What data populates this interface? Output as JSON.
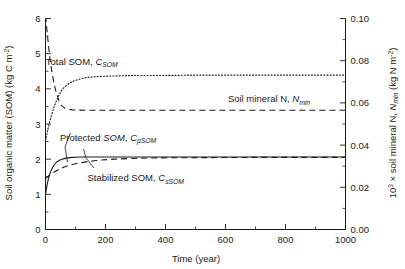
{
  "chart_data": {
    "type": "line",
    "title": "",
    "xlabel": "Time (year)",
    "ylabel_left": "Soil organic matter (SOM) (kg C m-2)",
    "ylabel_right": "103 x soil mineral N, Nmin (kg N m-2)",
    "xlim": [
      0,
      1000
    ],
    "ylim_left": [
      0,
      6
    ],
    "ylim_right": [
      0.0,
      0.1
    ],
    "grid": false,
    "legend_position": "inline-annotations",
    "x_ticks": [
      "0",
      "200",
      "400",
      "600",
      "800",
      "1000"
    ],
    "x_tick_values": [
      0,
      200,
      400,
      600,
      800,
      1000
    ],
    "x_minor_step": 100,
    "y_ticks_left": [
      "0",
      "1",
      "2",
      "3",
      "4",
      "5",
      "6"
    ],
    "y_tick_values_left": [
      0,
      1,
      2,
      3,
      4,
      5,
      6
    ],
    "y_minor_step_left": 0.5,
    "y_ticks_right": [
      "0.00",
      "0.02",
      "0.04",
      "0.06",
      "0.08",
      "0.10"
    ],
    "y_tick_values_right": [
      0.0,
      0.02,
      0.04,
      0.06,
      0.08,
      0.1
    ],
    "y_minor_step_right": 0.01,
    "series": [
      {
        "name": "Total SOM, CSOM",
        "axis": "left",
        "style": "dotted",
        "points": [
          [
            0,
            2.52
          ],
          [
            5,
            2.72
          ],
          [
            10,
            2.92
          ],
          [
            20,
            3.25
          ],
          [
            30,
            3.52
          ],
          [
            40,
            3.73
          ],
          [
            50,
            3.9
          ],
          [
            60,
            4.02
          ],
          [
            80,
            4.16
          ],
          [
            100,
            4.24
          ],
          [
            130,
            4.31
          ],
          [
            160,
            4.34
          ],
          [
            200,
            4.36
          ],
          [
            250,
            4.37
          ],
          [
            300,
            4.38
          ],
          [
            400,
            4.38
          ],
          [
            500,
            4.39
          ],
          [
            600,
            4.39
          ],
          [
            700,
            4.39
          ],
          [
            800,
            4.39
          ],
          [
            900,
            4.39
          ],
          [
            1000,
            4.39
          ]
        ]
      },
      {
        "name": "Soil mineral N, Nmin",
        "axis": "right",
        "style": "dashed",
        "points": [
          [
            0,
            0.101
          ],
          [
            3,
            0.097
          ],
          [
            8,
            0.09
          ],
          [
            14,
            0.082
          ],
          [
            20,
            0.076
          ],
          [
            26,
            0.071
          ],
          [
            32,
            0.067
          ],
          [
            38,
            0.064
          ],
          [
            45,
            0.061
          ],
          [
            52,
            0.059
          ],
          [
            60,
            0.058
          ],
          [
            70,
            0.0572
          ],
          [
            85,
            0.0568
          ],
          [
            100,
            0.0566
          ],
          [
            150,
            0.0565
          ],
          [
            200,
            0.0565
          ],
          [
            300,
            0.0565
          ],
          [
            400,
            0.0565
          ],
          [
            500,
            0.0565
          ],
          [
            600,
            0.0565
          ],
          [
            700,
            0.0565
          ],
          [
            800,
            0.0565
          ],
          [
            900,
            0.0565
          ],
          [
            1000,
            0.0565
          ]
        ]
      },
      {
        "name": "Protected SOM, CpSOM",
        "axis": "left",
        "style": "solid",
        "points": [
          [
            0,
            1.0
          ],
          [
            5,
            1.25
          ],
          [
            10,
            1.45
          ],
          [
            18,
            1.66
          ],
          [
            26,
            1.8
          ],
          [
            35,
            1.9
          ],
          [
            45,
            1.96
          ],
          [
            55,
            2.0
          ],
          [
            70,
            2.03
          ],
          [
            90,
            2.05
          ],
          [
            120,
            2.06
          ],
          [
            160,
            2.06
          ],
          [
            200,
            2.06
          ],
          [
            300,
            2.06
          ],
          [
            400,
            2.06
          ],
          [
            500,
            2.06
          ],
          [
            600,
            2.06
          ],
          [
            700,
            2.06
          ],
          [
            800,
            2.06
          ],
          [
            900,
            2.06
          ],
          [
            1000,
            2.06
          ]
        ]
      },
      {
        "name": "Stabilized SOM, CsSOM",
        "axis": "left",
        "style": "dashed",
        "points": [
          [
            0,
            1.45
          ],
          [
            10,
            1.52
          ],
          [
            25,
            1.61
          ],
          [
            45,
            1.71
          ],
          [
            70,
            1.8
          ],
          [
            100,
            1.87
          ],
          [
            140,
            1.93
          ],
          [
            180,
            1.97
          ],
          [
            230,
            2.0
          ],
          [
            290,
            2.02
          ],
          [
            360,
            2.035
          ],
          [
            450,
            2.04
          ],
          [
            550,
            2.045
          ],
          [
            700,
            2.05
          ],
          [
            850,
            2.05
          ],
          [
            1000,
            2.05
          ]
        ]
      }
    ],
    "annotations": [
      {
        "id": "total-som",
        "text_plain": "Total SOM, CSOM",
        "x": 1.0,
        "y": 4.68
      },
      {
        "id": "soil-mineral-n",
        "text_plain": "Soil mineral N, Nmin",
        "x": 608,
        "y": 3.62
      },
      {
        "id": "protected-som",
        "text_plain": "Protected SOM, CpSOM",
        "x": 48,
        "y": 2.52
      },
      {
        "id": "stabilized-som",
        "text_plain": "Stabilized SOM, CsSOM",
        "x": 140,
        "y": 1.37
      }
    ]
  },
  "labels": {
    "x_axis_title": "Time (year)",
    "y_axis_left_main": "Soil organic matter (SOM) (kg C m",
    "y_axis_left_sup": "-2",
    "y_axis_left_tail": ")",
    "y_axis_right_pre": "10",
    "y_axis_right_sup1": "3",
    "y_axis_right_mid": " × soil mineral N, ",
    "y_axis_right_n": "N",
    "y_axis_right_nsub": "min",
    "y_axis_right_unit": " (kg N m",
    "y_axis_right_sup2": "-2",
    "y_axis_right_tail": ")",
    "annot_total_a": "Total SOM, ",
    "annot_total_c": "C",
    "annot_total_sub": "SOM",
    "annot_nmin_a": "Soil mineral N, ",
    "annot_nmin_n": "N",
    "annot_nmin_sub": "min",
    "annot_psom_a": "Protected ",
    "annot_psom_som": "SOM",
    "annot_psom_comma": ", ",
    "annot_psom_c": "C",
    "annot_psom_sub": "pSOM",
    "annot_ssom_a": "Stabilized SOM, ",
    "annot_ssom_c": "C",
    "annot_ssom_sub": "sSOM"
  },
  "colors": {
    "ink": "#1a1a1a",
    "background": "#ffffff"
  }
}
